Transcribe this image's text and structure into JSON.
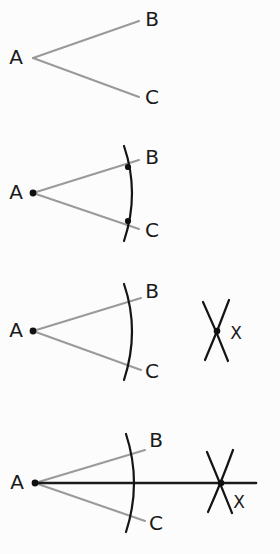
{
  "figure": {
    "background_color": "#fcfcfc",
    "ray_color": "#9a9a9a",
    "arc_color": "#141414",
    "bisector_color": "#1b1b1b",
    "label_color": "#1a1a1a"
  },
  "panels": [
    {
      "id": "step-1",
      "caption": "Angle BAC",
      "vertex": {
        "label": "A",
        "x": 33,
        "y": 58,
        "dot": false
      },
      "rays": [
        {
          "name": "ray-ab",
          "x1": 33,
          "y1": 58,
          "x2": 139,
          "y2": 21
        },
        {
          "name": "ray-ac",
          "x1": 33,
          "y1": 58,
          "x2": 139,
          "y2": 97
        }
      ],
      "labels": [
        {
          "text": "A",
          "x": 16,
          "y": 58
        },
        {
          "text": "B",
          "x": 152,
          "y": 20
        },
        {
          "text": "C",
          "x": 152,
          "y": 98
        }
      ],
      "arcs": [],
      "dots": []
    },
    {
      "id": "step-2",
      "caption": "Arc centred on A cuts both rays",
      "vertex": {
        "label": "A",
        "x": 33,
        "y": 193,
        "dot": true
      },
      "rays": [
        {
          "name": "ray-ab",
          "x1": 33,
          "y1": 193,
          "x2": 139,
          "y2": 160
        },
        {
          "name": "ray-ac",
          "x1": 33,
          "y1": 193,
          "x2": 139,
          "y2": 229
        }
      ],
      "labels": [
        {
          "text": "A",
          "x": 16,
          "y": 193
        },
        {
          "text": "B",
          "x": 152,
          "y": 158
        },
        {
          "text": "C",
          "x": 152,
          "y": 231
        }
      ],
      "arcs": [
        {
          "name": "arc-from-a",
          "d": "M 124 146 Q 140 193 124 241"
        }
      ],
      "dots": [
        {
          "name": "intersection-b",
          "x": 128,
          "y": 167,
          "r": 3.1
        },
        {
          "name": "intersection-c",
          "x": 128,
          "y": 221,
          "r": 3.1
        }
      ]
    },
    {
      "id": "step-3",
      "caption": "Equal arcs from the two cut points meet at X",
      "vertex": {
        "label": "A",
        "x": 33,
        "y": 331,
        "dot": true
      },
      "rays": [
        {
          "name": "ray-ab",
          "x1": 33,
          "y1": 331,
          "x2": 141,
          "y2": 298
        },
        {
          "name": "ray-ac",
          "x1": 33,
          "y1": 331,
          "x2": 141,
          "y2": 370
        }
      ],
      "labels": [
        {
          "text": "A",
          "x": 16,
          "y": 331
        },
        {
          "text": "B",
          "x": 152,
          "y": 292
        },
        {
          "text": "C",
          "x": 152,
          "y": 372
        },
        {
          "text": "X",
          "x": 236,
          "y": 334
        }
      ],
      "arcs": [
        {
          "name": "arc-from-a",
          "d": "M 124 284 Q 140 331 124 380"
        },
        {
          "name": "arc-from-b",
          "d": "M 203 302 Q 216 330 228 361"
        },
        {
          "name": "arc-from-c",
          "d": "M 229 300 Q 218 330 205 360"
        }
      ],
      "dots": [
        {
          "name": "intersection-x",
          "x": 217,
          "y": 331,
          "r": 3.3
        }
      ]
    },
    {
      "id": "step-4",
      "caption": "Line AX bisects the angle",
      "vertex": {
        "label": "A",
        "x": 35,
        "y": 483,
        "dot": true
      },
      "rays": [
        {
          "name": "ray-ab",
          "x1": 35,
          "y1": 483,
          "x2": 145,
          "y2": 450
        },
        {
          "name": "ray-ac",
          "x1": 35,
          "y1": 483,
          "x2": 145,
          "y2": 521
        }
      ],
      "bisector": {
        "name": "bisector-ax",
        "x1": 35,
        "y1": 483,
        "x2": 256,
        "y2": 483
      },
      "labels": [
        {
          "text": "A",
          "x": 17,
          "y": 483
        },
        {
          "text": "B",
          "x": 156,
          "y": 441
        },
        {
          "text": "C",
          "x": 156,
          "y": 524
        },
        {
          "text": "X",
          "x": 239,
          "y": 503
        }
      ],
      "arcs": [
        {
          "name": "arc-from-a",
          "d": "M 126 434 Q 142 483 126 532"
        },
        {
          "name": "arc-from-b",
          "d": "M 207 452 Q 220 483 232 513"
        },
        {
          "name": "arc-from-c",
          "d": "M 233 450 Q 221 483 208 512"
        }
      ],
      "dots": [
        {
          "name": "intersection-x",
          "x": 221,
          "y": 483,
          "r": 3.3
        }
      ]
    }
  ]
}
